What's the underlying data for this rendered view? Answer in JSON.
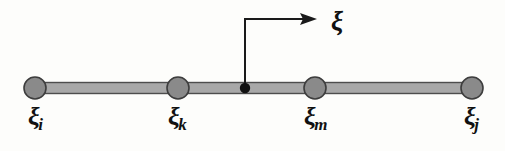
{
  "figure": {
    "background_color": "#fdfdfb",
    "ink_color": "#1a1a1a",
    "bar": {
      "fill_color": "#a8a8a8",
      "stroke_color": "#4d4d4d",
      "x_start": 35,
      "x_end": 472,
      "y_center": 88,
      "thickness": 11
    },
    "nodes": [
      {
        "id": "i",
        "label_glyph": "ξ",
        "label_subscript": "i",
        "cx": 35,
        "cy": 88,
        "r": 11,
        "fill_color": "#8a8a8a",
        "stroke_color": "#3d3d3d",
        "label_x": 28,
        "label_y": 104
      },
      {
        "id": "k",
        "label_glyph": "ξ",
        "label_subscript": "k",
        "cx": 178,
        "cy": 88,
        "r": 11,
        "fill_color": "#8a8a8a",
        "stroke_color": "#3d3d3d",
        "label_x": 168,
        "label_y": 104
      },
      {
        "id": "m",
        "label_glyph": "ξ",
        "label_subscript": "m",
        "cx": 315,
        "cy": 88,
        "r": 11,
        "fill_color": "#8a8a8a",
        "stroke_color": "#3d3d3d",
        "label_x": 304,
        "label_y": 104
      },
      {
        "id": "j",
        "label_glyph": "ξ",
        "label_subscript": "j",
        "cx": 472,
        "cy": 88,
        "r": 11,
        "fill_color": "#8a8a8a",
        "stroke_color": "#3d3d3d",
        "label_x": 464,
        "label_y": 104
      }
    ],
    "sample_point": {
      "cx": 245,
      "cy": 88,
      "r": 5,
      "fill_color": "#111111"
    },
    "arrow": {
      "label": "ξ",
      "label_x": 331,
      "label_y": 12,
      "stroke_color": "#1a1a1a",
      "stroke_width": 2,
      "vertical_x": 245,
      "vertical_y_bottom": 88,
      "vertical_y_top": 19,
      "horizontal_y": 19,
      "horizontal_x_start": 245,
      "horizontal_x_end": 303,
      "head_tip_x": 317,
      "head_half_height": 6
    }
  }
}
